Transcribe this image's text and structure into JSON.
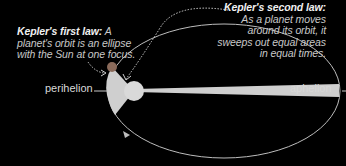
{
  "callouts": {
    "first_law": {
      "heading": "Kepler's first law:",
      "text": "A planet's orbit is an ellipse with the Sun at one focus."
    },
    "second_law": {
      "heading": "Kepler's second law:",
      "text": "As a planet moves around its orbit, it sweeps out equal areas in equal times."
    }
  },
  "labels": {
    "perihelion": "perihelion",
    "aphelion": "aphelion"
  },
  "colors": {
    "background": "#000000",
    "orbit": "#bdbdbd",
    "swept_area": "#cfcfcf",
    "sun": "#d9d9d9",
    "planet": "#8a6a5a",
    "text": "#c8c8c8"
  }
}
